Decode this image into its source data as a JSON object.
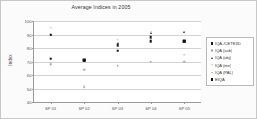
{
  "chart_data": {
    "type": "scatter",
    "title": "Average Indices in 2005",
    "xlabel": "",
    "ylabel": "Index",
    "ylim": [
      40,
      100
    ],
    "yticks": [
      100,
      90,
      80,
      70,
      60,
      50,
      40
    ],
    "grid": true,
    "legend_position": "right",
    "categories": [
      "SP 01",
      "SP 02",
      "SP 03",
      "SP 04",
      "SP 05"
    ],
    "series": [
      {
        "name": "IQA-/CETE3D",
        "marker": "square",
        "color": "#1d1d1d",
        "values": [
          90,
          71,
          82,
          88,
          85
        ]
      },
      {
        "name": "IQA (sub)",
        "marker": "circle",
        "color": "#9d9d9d",
        "values": [
          68,
          64,
          67,
          70,
          70
        ]
      },
      {
        "name": "IQA (obj)",
        "marker": "triangle",
        "color": "#2a2a2a",
        "values": [
          90,
          71,
          84,
          91,
          92
        ]
      },
      {
        "name": "IQA (me)",
        "marker": "cross",
        "color": "#8c8c8c",
        "values": [
          95,
          52,
          86,
          92,
          92
        ]
      },
      {
        "name": "IQA (PAL)",
        "marker": "dot",
        "color": "#b4b4b4",
        "values": [
          72,
          51,
          78,
          85,
          75
        ]
      },
      {
        "name": "EIQA",
        "marker": "square-filled",
        "color": "#111111",
        "values": [
          72,
          71,
          78,
          85,
          85
        ]
      }
    ]
  },
  "legend": {
    "items": [
      {
        "label": "IQA-/CETE3D",
        "symbol": "square-marker"
      },
      {
        "label": "IQA (sub)",
        "symbol": "circle-marker"
      },
      {
        "label": "IQA (obj)",
        "symbol": "triangle-marker"
      },
      {
        "label": "IQA (me)",
        "symbol": "cross-marker"
      },
      {
        "label": "IQA (PAL)",
        "symbol": "dot-marker"
      },
      {
        "label": "EIQA",
        "symbol": "square-filled-marker"
      }
    ]
  }
}
